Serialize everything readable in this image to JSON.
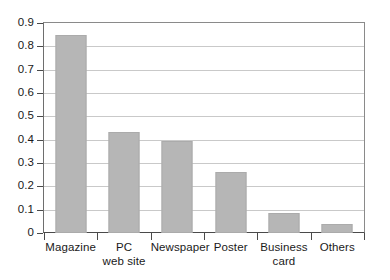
{
  "chart_data": {
    "type": "bar",
    "title": "",
    "subtitle": "",
    "xlabel": "",
    "ylabel": "",
    "categories": [
      "Magazine",
      "PC web site",
      "Newspaper",
      "Poster",
      "Business card",
      "Others"
    ],
    "category_lines": [
      [
        "Magazine"
      ],
      [
        "PC",
        "web site"
      ],
      [
        "Newspaper"
      ],
      [
        "Poster"
      ],
      [
        "Business",
        "card"
      ],
      [
        "Others"
      ]
    ],
    "values": [
      0.85,
      0.435,
      0.395,
      0.26,
      0.085,
      0.04
    ],
    "ylim": [
      0,
      0.9
    ],
    "ytick_values": [
      0,
      0.1,
      0.2,
      0.3,
      0.4,
      0.5,
      0.6,
      0.7,
      0.8,
      0.9
    ],
    "ytick_labels": [
      "0",
      "0.1",
      "0.2",
      "0.3",
      "0.4",
      "0.5",
      "0.6",
      "0.7",
      "0.8",
      "0.9"
    ],
    "grid": true,
    "grid_axis": "y",
    "legend": false,
    "legend_position": "none",
    "bar_color": "#b6b6b6",
    "bar_edge_color": "#ababab",
    "grid_color": "#c9c9c9",
    "axis_color": "#4a4a4a",
    "background_color": "#ffffff",
    "text_color": "#1a1a1a"
  }
}
